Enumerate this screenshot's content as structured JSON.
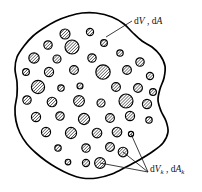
{
  "figure": {
    "background_color": "#ffffff",
    "outline_color": "#000000",
    "inclusion_fill": "hatch-diagonal",
    "width": 202,
    "height": 192
  },
  "labels": {
    "matrix": {
      "name": "matrix-label",
      "d1": "d",
      "var1": "V",
      "separator": " , ",
      "d2": "d",
      "var2": "A",
      "full_text": "dV , dA",
      "x": 134,
      "y": 24
    },
    "inclusion": {
      "name": "inclusion-label",
      "d1": "d",
      "var1": "V",
      "sub1": "k",
      "separator": " , ",
      "d2": "d",
      "var2": "A",
      "sub2": "k",
      "full_text": "dVk , dAk",
      "x": 150,
      "y": 172
    }
  },
  "leader_lines": {
    "matrix": {
      "name": "matrix-leader-line",
      "from": [
        106,
        37
      ],
      "to": [
        132,
        21
      ]
    },
    "inclusion": {
      "name": "inclusion-leader-lines",
      "target": [
        148,
        172
      ],
      "sources": [
        [
          131,
          134
        ],
        [
          123,
          152
        ],
        [
          100,
          163
        ]
      ]
    }
  },
  "blob_outline": {
    "name": "body-outline",
    "points": [
      [
        96,
        13
      ],
      [
        112,
        17
      ],
      [
        124,
        24
      ],
      [
        133,
        33
      ],
      [
        142,
        41
      ],
      [
        152,
        47
      ],
      [
        160,
        55
      ],
      [
        165,
        66
      ],
      [
        164,
        78
      ],
      [
        160,
        89
      ],
      [
        158,
        100
      ],
      [
        161,
        111
      ],
      [
        166,
        121
      ],
      [
        168,
        132
      ],
      [
        163,
        143
      ],
      [
        152,
        152
      ],
      [
        139,
        160
      ],
      [
        126,
        167
      ],
      [
        112,
        174
      ],
      [
        97,
        178
      ],
      [
        82,
        178
      ],
      [
        69,
        174
      ],
      [
        57,
        168
      ],
      [
        46,
        161
      ],
      [
        36,
        153
      ],
      [
        27,
        144
      ],
      [
        20,
        133
      ],
      [
        16,
        121
      ],
      [
        15,
        108
      ],
      [
        17,
        95
      ],
      [
        17,
        82
      ],
      [
        15,
        69
      ],
      [
        17,
        57
      ],
      [
        24,
        46
      ],
      [
        33,
        36
      ],
      [
        44,
        28
      ],
      [
        56,
        21
      ],
      [
        69,
        16
      ],
      [
        82,
        13
      ]
    ]
  },
  "inclusions": [
    {
      "cx": 65,
      "cy": 34,
      "r": 5.0
    },
    {
      "cx": 90,
      "cy": 32,
      "r": 3.6
    },
    {
      "cx": 48,
      "cy": 45,
      "r": 4.2
    },
    {
      "cx": 72,
      "cy": 47,
      "r": 7.0
    },
    {
      "cx": 104,
      "cy": 43,
      "r": 3.4
    },
    {
      "cx": 34,
      "cy": 58,
      "r": 5.2
    },
    {
      "cx": 57,
      "cy": 59,
      "r": 4.0
    },
    {
      "cx": 92,
      "cy": 58,
      "r": 4.2
    },
    {
      "cx": 120,
      "cy": 53,
      "r": 3.2
    },
    {
      "cx": 140,
      "cy": 62,
      "r": 4.2
    },
    {
      "cx": 26,
      "cy": 72,
      "r": 3.4
    },
    {
      "cx": 49,
      "cy": 72,
      "r": 4.6
    },
    {
      "cx": 74,
      "cy": 70,
      "r": 4.4
    },
    {
      "cx": 103,
      "cy": 72,
      "r": 7.2
    },
    {
      "cx": 127,
      "cy": 70,
      "r": 4.4
    },
    {
      "cx": 150,
      "cy": 76,
      "r": 3.6
    },
    {
      "cx": 38,
      "cy": 87,
      "r": 6.6
    },
    {
      "cx": 61,
      "cy": 88,
      "r": 3.2
    },
    {
      "cx": 80,
      "cy": 86,
      "r": 3.0
    },
    {
      "cx": 116,
      "cy": 87,
      "r": 4.4
    },
    {
      "cx": 138,
      "cy": 88,
      "r": 4.4
    },
    {
      "cx": 153,
      "cy": 92,
      "r": 3.4
    },
    {
      "cx": 27,
      "cy": 100,
      "r": 4.2
    },
    {
      "cx": 52,
      "cy": 102,
      "r": 4.8
    },
    {
      "cx": 79,
      "cy": 101,
      "r": 5.4
    },
    {
      "cx": 101,
      "cy": 103,
      "r": 4.0
    },
    {
      "cx": 126,
      "cy": 101,
      "r": 7.0
    },
    {
      "cx": 147,
      "cy": 104,
      "r": 4.6
    },
    {
      "cx": 36,
      "cy": 117,
      "r": 4.6
    },
    {
      "cx": 60,
      "cy": 116,
      "r": 4.2
    },
    {
      "cx": 84,
      "cy": 119,
      "r": 5.6
    },
    {
      "cx": 110,
      "cy": 118,
      "r": 4.4
    },
    {
      "cx": 130,
      "cy": 116,
      "r": 4.6
    },
    {
      "cx": 149,
      "cy": 120,
      "r": 3.2
    },
    {
      "cx": 46,
      "cy": 132,
      "r": 4.6
    },
    {
      "cx": 71,
      "cy": 133,
      "r": 5.6
    },
    {
      "cx": 97,
      "cy": 133,
      "r": 4.8
    },
    {
      "cx": 117,
      "cy": 132,
      "r": 4.8
    },
    {
      "cx": 131,
      "cy": 134,
      "r": 2.6
    },
    {
      "cx": 58,
      "cy": 148,
      "r": 3.2
    },
    {
      "cx": 86,
      "cy": 148,
      "r": 4.2
    },
    {
      "cx": 110,
      "cy": 147,
      "r": 4.4
    },
    {
      "cx": 123,
      "cy": 152,
      "r": 4.8
    },
    {
      "cx": 68,
      "cy": 162,
      "r": 2.8
    },
    {
      "cx": 86,
      "cy": 163,
      "r": 3.6
    },
    {
      "cx": 100,
      "cy": 163,
      "r": 5.4
    }
  ]
}
